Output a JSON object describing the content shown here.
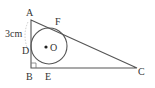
{
  "diagram": {
    "type": "geometry",
    "points": {
      "A": {
        "label": "A",
        "x": 31,
        "y": 20
      },
      "B": {
        "label": "B",
        "x": 31,
        "y": 68
      },
      "C": {
        "label": "C",
        "x": 137,
        "y": 68
      },
      "D": {
        "label": "D"
      },
      "E": {
        "label": "E"
      },
      "F": {
        "label": "F"
      },
      "O": {
        "label": "O"
      }
    },
    "measurement": {
      "segment": "AD",
      "label": "3cm"
    },
    "colors": {
      "stroke": "#555555",
      "text": "#333333"
    }
  }
}
